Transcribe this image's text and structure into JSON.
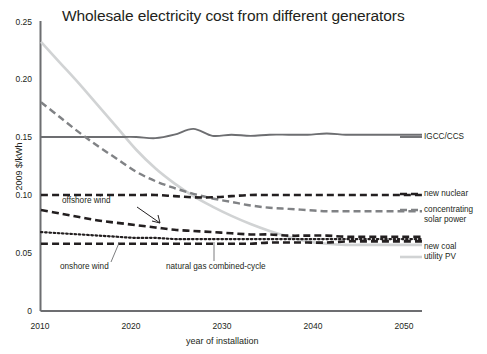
{
  "chart_data": {
    "type": "line",
    "title": "Wholesale electricity cost from different generators",
    "xlabel": "year of installation",
    "ylabel": "2009 $/kWh",
    "xlim": [
      2010,
      2050
    ],
    "ylim": [
      0,
      0.25
    ],
    "xticks": [
      "2010",
      "2020",
      "2030",
      "2040",
      "2050"
    ],
    "yticks": [
      "0",
      "0.05",
      "0.10",
      "0.15",
      "0.20",
      "0.25"
    ],
    "grid": false,
    "legend_position": "right-inline-labels",
    "x": [
      2010,
      2012,
      2014,
      2016,
      2018,
      2020,
      2022,
      2024,
      2026,
      2028,
      2030,
      2032,
      2034,
      2036,
      2038,
      2040,
      2042,
      2044,
      2046,
      2048,
      2050
    ],
    "series": [
      {
        "name": "IGCC/CCS",
        "label": "IGCC/CCS",
        "color": "#6d6e71",
        "style": "solid",
        "values": [
          0.15,
          0.15,
          0.15,
          0.15,
          0.15,
          0.15,
          0.149,
          0.152,
          0.157,
          0.151,
          0.152,
          0.151,
          0.152,
          0.152,
          0.152,
          0.153,
          0.152,
          0.152,
          0.152,
          0.152,
          0.152
        ]
      },
      {
        "name": "new nuclear",
        "label": "new nuclear",
        "color": "#231f20",
        "style": "dashed",
        "values": [
          0.1,
          0.1,
          0.1,
          0.1,
          0.1,
          0.1,
          0.1,
          0.099,
          0.098,
          0.098,
          0.099,
          0.1,
          0.1,
          0.1,
          0.1,
          0.1,
          0.1,
          0.1,
          0.1,
          0.1,
          0.1
        ]
      },
      {
        "name": "concentrating solar power",
        "label": "concentrating solar power",
        "color": "#808285",
        "style": "dashed",
        "values": [
          0.18,
          0.167,
          0.154,
          0.142,
          0.131,
          0.12,
          0.112,
          0.106,
          0.101,
          0.097,
          0.094,
          0.091,
          0.089,
          0.088,
          0.087,
          0.086,
          0.086,
          0.086,
          0.086,
          0.086,
          0.086
        ]
      },
      {
        "name": "utility PV",
        "label": "utility PV",
        "color": "#d1d3d4",
        "style": "solid",
        "values": [
          0.232,
          0.214,
          0.196,
          0.177,
          0.158,
          0.139,
          0.123,
          0.11,
          0.099,
          0.09,
          0.082,
          0.075,
          0.069,
          0.064,
          0.06,
          0.058,
          0.057,
          0.057,
          0.057,
          0.057,
          0.057
        ]
      },
      {
        "name": "offshore wind",
        "label": "offshore wind",
        "color": "#231f20",
        "style": "dashed",
        "values": [
          0.087,
          0.084,
          0.081,
          0.078,
          0.076,
          0.074,
          0.072,
          0.07,
          0.069,
          0.068,
          0.067,
          0.066,
          0.066,
          0.065,
          0.065,
          0.065,
          0.064,
          0.064,
          0.064,
          0.064,
          0.064
        ]
      },
      {
        "name": "onshore wind",
        "label": "onshore wind",
        "color": "#231f20",
        "style": "dotted",
        "values": [
          0.068,
          0.067,
          0.066,
          0.065,
          0.064,
          0.063,
          0.063,
          0.062,
          0.062,
          0.062,
          0.062,
          0.062,
          0.062,
          0.062,
          0.062,
          0.062,
          0.062,
          0.062,
          0.062,
          0.062,
          0.062
        ]
      },
      {
        "name": "new coal",
        "label": "new coal",
        "color": "#231f20",
        "style": "dashed",
        "values": [
          0.058,
          0.058,
          0.058,
          0.058,
          0.058,
          0.058,
          0.058,
          0.058,
          0.058,
          0.058,
          0.058,
          0.058,
          0.059,
          0.059,
          0.059,
          0.059,
          0.06,
          0.06,
          0.06,
          0.06,
          0.06
        ]
      }
    ],
    "annotations": [
      {
        "name": "offshore-wind",
        "text": "offshore wind"
      },
      {
        "name": "onshore-wind",
        "text": "onshore wind"
      },
      {
        "name": "natural-gas-combined-cycle",
        "text": "natural gas combined-cycle"
      }
    ],
    "right_labels": [
      {
        "name": "igcc-ccs",
        "text": "IGCC/CCS"
      },
      {
        "name": "new-nuclear",
        "text": "new nuclear"
      },
      {
        "name": "concentrating-solar-power-line1",
        "text": "concentrating"
      },
      {
        "name": "concentrating-solar-power-line2",
        "text": "solar power"
      },
      {
        "name": "new-coal",
        "text": "new coal"
      },
      {
        "name": "utility-pv",
        "text": "utility PV"
      }
    ],
    "colors": {
      "axis": "#6d6e71",
      "dark": "#231f20",
      "mid_gray": "#808285",
      "light_gray": "#d1d3d4",
      "background": "#ffffff"
    }
  }
}
